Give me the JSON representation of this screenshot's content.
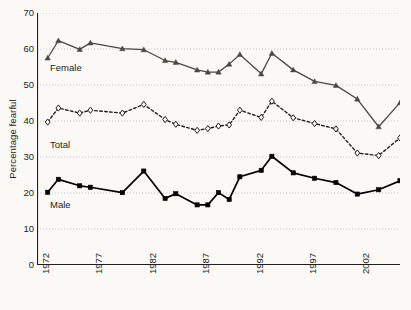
{
  "chart_data": {
    "type": "line",
    "title": "",
    "xlabel": "",
    "ylabel": "Percentage fearful",
    "xlim": [
      1972,
      2006
    ],
    "ylim": [
      0,
      70
    ],
    "yticks": [
      0,
      10,
      20,
      30,
      40,
      50,
      60,
      70
    ],
    "xticks_labeled": [
      1972,
      1977,
      1982,
      1987,
      1992,
      1997,
      2002
    ],
    "xtick_interval": 1,
    "grid": "horizontal-dotted",
    "legend": "inline-series-labels",
    "x": [
      1973,
      1974,
      1976,
      1977,
      1980,
      1982,
      1984,
      1985,
      1987,
      1988,
      1989,
      1990,
      1991,
      1993,
      1994,
      1996,
      1998,
      2000,
      2002,
      2004,
      2006
    ],
    "series": [
      {
        "name": "Female",
        "marker": "filled-triangle",
        "linestyle": "solid",
        "color": "#4a4a42",
        "values": [
          57.5,
          62.3,
          59.9,
          61.7,
          60.1,
          59.8,
          56.8,
          56.3,
          54.2,
          53.6,
          53.6,
          55.8,
          58.5,
          53.1,
          58.8,
          54.2,
          51.0,
          49.9,
          46.1,
          38.4,
          45.1
        ]
      },
      {
        "name": "Total",
        "marker": "open-diamond",
        "linestyle": "dashed",
        "color": "#231f20",
        "values": [
          39.7,
          43.6,
          42.2,
          43.0,
          42.2,
          44.6,
          40.4,
          39.1,
          37.4,
          37.9,
          38.6,
          38.9,
          43.0,
          41.0,
          45.5,
          40.9,
          39.3,
          37.8,
          31.1,
          30.4,
          35.3
        ]
      },
      {
        "name": "Male",
        "marker": "filled-square",
        "linestyle": "solid",
        "color": "#000000",
        "values": [
          20.2,
          23.8,
          22.0,
          21.6,
          20.1,
          26.1,
          18.5,
          19.8,
          16.7,
          16.7,
          20.1,
          18.2,
          24.5,
          26.3,
          30.2,
          25.6,
          24.1,
          22.9,
          19.7,
          20.9,
          23.4
        ]
      }
    ]
  },
  "axes": {
    "ylabel": "Percentage fearful",
    "ytick_labels": [
      "70",
      "60",
      "50",
      "40",
      "30",
      "20",
      "10",
      "0"
    ],
    "xtick_labels": [
      "1972",
      "1977",
      "1982",
      "1987",
      "1992",
      "1997",
      "2002"
    ]
  },
  "series_labels": {
    "female": "Female",
    "total": "Total",
    "male": "Male"
  },
  "colors": {
    "background": "#faf9f5",
    "axis": "#231f20",
    "grid": "#b9c4cc",
    "female": "#4a4a42",
    "total": "#231f20",
    "male": "#000000"
  }
}
